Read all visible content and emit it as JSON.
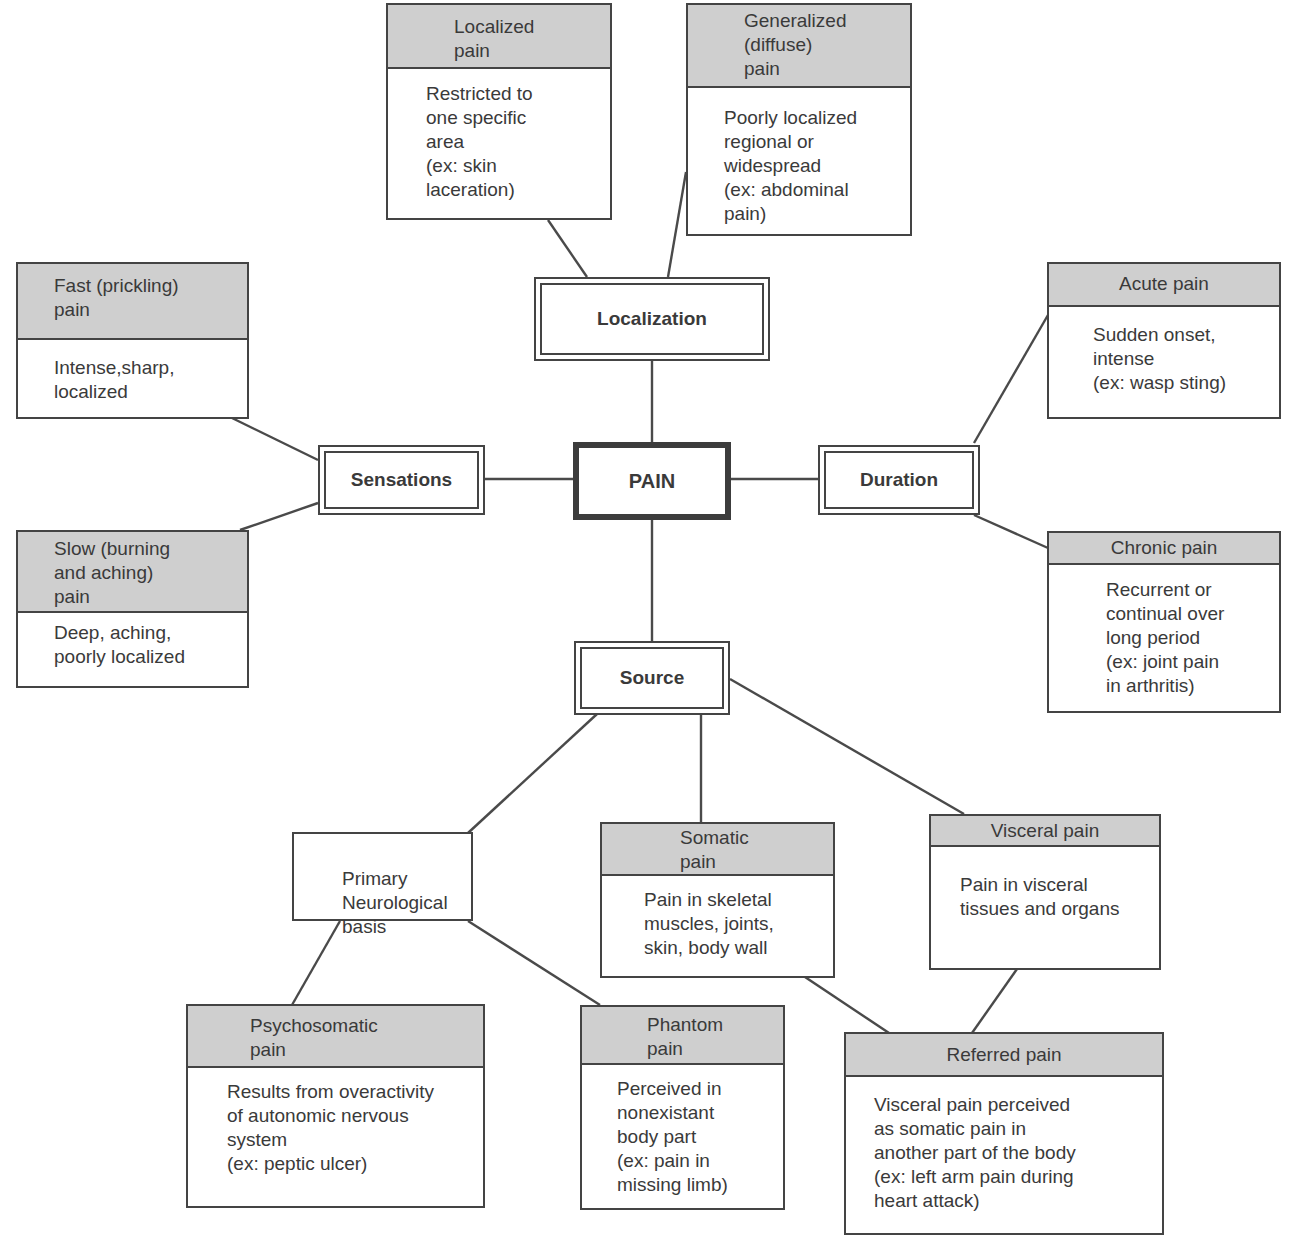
{
  "root": {
    "label": "PAIN"
  },
  "categories": {
    "localization": "Localization",
    "sensations": "Sensations",
    "duration": "Duration",
    "source": "Source"
  },
  "nodes": {
    "localized": {
      "title": "Localized\npain",
      "body": "Restricted to\none specific\narea\n(ex: skin\nlaceration)"
    },
    "generalized": {
      "title": "Generalized\n(diffuse)\npain",
      "body": "Poorly localized\nregional or\nwidespread\n(ex: abdominal\npain)"
    },
    "fast": {
      "title": "Fast (prickling)\npain",
      "body": "Intense,sharp,\nlocalized"
    },
    "slow": {
      "title": "Slow (burning\nand aching)\npain",
      "body": "Deep, aching,\npoorly localized"
    },
    "acute": {
      "title": "Acute pain",
      "body": "Sudden onset,\nintense\n(ex: wasp sting)"
    },
    "chronic": {
      "title": "Chronic pain",
      "body": "Recurrent or\ncontinual over\nlong period\n(ex: joint pain\nin arthritis)"
    },
    "primary": {
      "body": "Primary\nNeurological\nbasis"
    },
    "somatic": {
      "title": "Somatic\npain",
      "body": "Pain in skeletal\nmuscles, joints,\nskin, body wall"
    },
    "visceral": {
      "title": "Visceral pain",
      "body": "Pain in visceral\ntissues and organs"
    },
    "psychosomatic": {
      "title": "Psychosomatic\npain",
      "body": "Results from overactivity\nof autonomic nervous\nsystem\n(ex: peptic ulcer)"
    },
    "phantom": {
      "title": "Phantom\npain",
      "body": "Perceived in\nnonexistant\nbody part\n(ex: pain in\nmissing limb)"
    },
    "referred": {
      "title": "Referred pain",
      "body": "Visceral pain perceived\nas somatic pain in\nanother part of the body\n(ex: left arm pain during\nheart attack)"
    }
  },
  "colors": {
    "header_fill": "#cfcfcf",
    "line": "#444444",
    "text": "#3a3a3a"
  }
}
